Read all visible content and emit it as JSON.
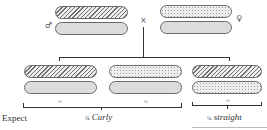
{
  "parents": {
    "male": {
      "symbol": "♂",
      "chromosomes": [
        "hatched",
        "plain"
      ]
    },
    "cross_symbol": "×",
    "female": {
      "symbol": "♀",
      "chromosomes": [
        "dotted",
        "plain"
      ]
    }
  },
  "offspring": [
    {
      "chromosomes": [
        "hatched",
        "plain"
      ],
      "fraction": "¼"
    },
    {
      "chromosomes": [
        "dotted",
        "plain"
      ],
      "fraction": "¼"
    },
    {
      "chromosomes": [
        "hatched",
        "dotted"
      ],
      "fraction": "¼"
    }
  ],
  "expectation": {
    "label": "Expect",
    "groups": [
      {
        "fraction": "¾",
        "phenotype": "Curly"
      },
      {
        "fraction": "¼",
        "phenotype": "straight"
      }
    ]
  },
  "colors": {
    "line": "#333333",
    "plain_fill": "#dcdcdc",
    "outline": "#6a6a6a"
  }
}
